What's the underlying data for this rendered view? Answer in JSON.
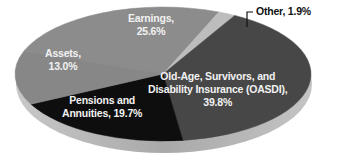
{
  "chart_data": {
    "type": "pie",
    "title": "",
    "style": "3d-tilted",
    "slices": [
      {
        "label": "Earnings",
        "value": 25.6,
        "display": "Earnings,\n25.6%",
        "color": "#8c8c8c"
      },
      {
        "label": "Other",
        "value": 1.9,
        "display": "Other, 1.9%",
        "color": "#bdbdbd"
      },
      {
        "label": "Old-Age, Survivors, and Disability Insurance (OASDI)",
        "value": 39.8,
        "display": "Old-Age, Survivors, and\nDisability Insurance (OASDI),\n39.8%",
        "color": "#474747"
      },
      {
        "label": "Pensions and Annuities",
        "value": 19.7,
        "display": "Pensions and\nAnnuities, 19.7%",
        "color": "#0e0e0e"
      },
      {
        "label": "Assets",
        "value": 13.0,
        "display": "Assets,\n13.0%",
        "color": "#878787"
      }
    ],
    "labels": {
      "earnings": {
        "line1": "Earnings,",
        "line2": "25.6%"
      },
      "other": {
        "line1": "Other, 1.9%"
      },
      "oasdi": {
        "line1": "Old-Age, Survivors, and",
        "line2": "Disability Insurance (OASDI),",
        "line3": "39.8%"
      },
      "pensions": {
        "line1": "Pensions and",
        "line2": "Annuities, 19.7%"
      },
      "assets": {
        "line1": "Assets,",
        "line2": "13.0%"
      }
    },
    "legend": null,
    "units": "percent"
  }
}
